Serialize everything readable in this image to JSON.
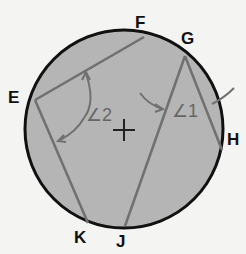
{
  "diagram": {
    "points": {
      "E": "E",
      "F": "F",
      "G": "G",
      "H": "H",
      "J": "J",
      "K": "K"
    },
    "angles": {
      "angle1": "∠1",
      "angle2": "∠2"
    },
    "colors": {
      "circle_fill": "#b5b5b5",
      "circle_stroke": "#111111",
      "chord": "#707070",
      "background": "#f4f4f2"
    }
  }
}
